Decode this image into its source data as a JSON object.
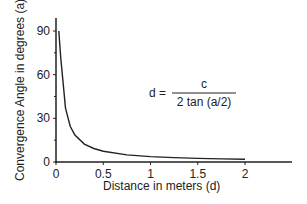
{
  "chart_data": {
    "type": "line",
    "title": "",
    "xlabel": "Distance in meters (d)",
    "ylabel": "Convergence Angle in degrees (a)",
    "x_ticks": [
      "0",
      "0.5",
      "1",
      "1.5",
      "2"
    ],
    "y_ticks": [
      "0",
      "30",
      "60",
      "90"
    ],
    "xlim": [
      0,
      2.5
    ],
    "ylim": [
      0,
      100
    ],
    "grid": false,
    "annotation": {
      "lhs": "d =",
      "numerator": "c",
      "denominator": "2 tan (a/2)"
    },
    "series": [
      {
        "name": "Convergence angle",
        "x": [
          0.03,
          0.05,
          0.1,
          0.15,
          0.2,
          0.3,
          0.4,
          0.5,
          0.75,
          1.0,
          1.25,
          1.5,
          1.75,
          2.0
        ],
        "values": [
          90,
          72,
          37,
          24.5,
          18.5,
          12.3,
          9.3,
          7.4,
          4.9,
          3.7,
          3.0,
          2.5,
          2.1,
          1.9
        ]
      }
    ]
  }
}
